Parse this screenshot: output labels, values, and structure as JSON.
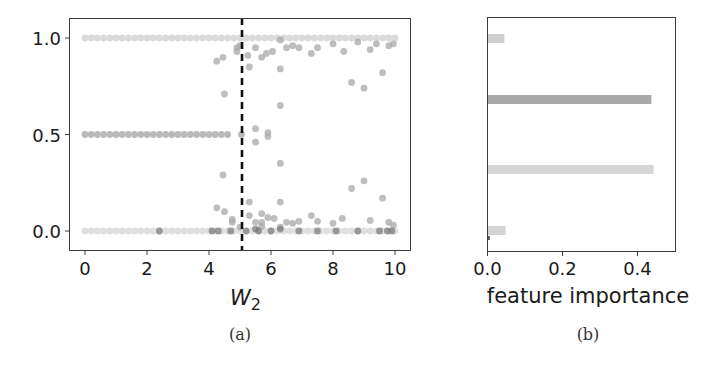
{
  "chart_data": [
    {
      "panel": "a",
      "type": "scatter",
      "title": "",
      "caption": "(a)",
      "xlabel": "W",
      "xlabel_subscript": "2",
      "ylabel": "",
      "xlim": [
        -0.4,
        10.5
      ],
      "ylim": [
        -0.1,
        1.08
      ],
      "xticks": [
        "0",
        "2",
        "4",
        "6",
        "8",
        "10"
      ],
      "yticks": [
        "0.0",
        "0.5",
        "1.0"
      ],
      "grid": false,
      "vline": {
        "x": 5.06,
        "style": "dashed",
        "color": "#111111"
      },
      "series": [
        {
          "name": "row-1.0",
          "color": "#d4d4d4",
          "points_rule": "x from 0 to 10 step 0.2, y = 1.0"
        },
        {
          "name": "row-0.5",
          "color": "#b3b3b3",
          "points_rule": "x from 0 to 4.6 step 0.2, y = 0.5, plus (5.05, 0.5)"
        },
        {
          "name": "row-0.0",
          "color": "#d9d9d9",
          "points_rule": "x from 0 to 10 step 0.2, y = 0.0"
        },
        {
          "name": "transition-points",
          "color": "#a8a8a8",
          "points": [
            [
              4.25,
              0.88
            ],
            [
              4.45,
              0.9
            ],
            [
              4.9,
              0.93
            ],
            [
              4.9,
              0.95
            ],
            [
              5.0,
              0.96
            ],
            [
              5.25,
              0.91
            ],
            [
              5.5,
              0.95
            ],
            [
              5.7,
              0.9
            ],
            [
              5.85,
              0.92
            ],
            [
              6.05,
              0.93
            ],
            [
              6.3,
              0.99
            ],
            [
              6.5,
              0.95
            ],
            [
              6.7,
              0.96
            ],
            [
              6.9,
              0.95
            ],
            [
              7.3,
              0.92
            ],
            [
              7.5,
              0.95
            ],
            [
              8.0,
              0.97
            ],
            [
              8.35,
              0.93
            ],
            [
              8.8,
              0.98
            ],
            [
              9.2,
              0.94
            ],
            [
              9.4,
              0.97
            ],
            [
              9.8,
              0.96
            ],
            [
              9.95,
              0.97
            ],
            [
              5.3,
              0.85
            ],
            [
              6.3,
              0.84
            ],
            [
              8.6,
              0.77
            ],
            [
              9.0,
              0.74
            ],
            [
              9.6,
              0.82
            ],
            [
              4.5,
              0.71
            ],
            [
              6.3,
              0.65
            ],
            [
              5.5,
              0.53
            ],
            [
              5.9,
              0.51
            ],
            [
              5.9,
              0.49
            ],
            [
              5.5,
              0.46
            ],
            [
              6.3,
              0.35
            ],
            [
              4.45,
              0.29
            ],
            [
              9.0,
              0.26
            ],
            [
              8.6,
              0.22
            ],
            [
              9.6,
              0.17
            ],
            [
              5.3,
              0.15
            ],
            [
              6.3,
              0.15
            ],
            [
              4.25,
              0.12
            ],
            [
              4.5,
              0.1
            ],
            [
              5.7,
              0.09
            ],
            [
              5.3,
              0.08
            ],
            [
              5.9,
              0.07
            ],
            [
              6.1,
              0.065
            ],
            [
              7.3,
              0.08
            ],
            [
              8.3,
              0.065
            ],
            [
              9.2,
              0.055
            ],
            [
              4.75,
              0.06
            ],
            [
              4.75,
              0.045
            ],
            [
              5.5,
              0.045
            ],
            [
              5.7,
              0.045
            ],
            [
              6.5,
              0.045
            ],
            [
              6.7,
              0.04
            ],
            [
              6.9,
              0.05
            ],
            [
              7.5,
              0.05
            ],
            [
              8.0,
              0.04
            ],
            [
              9.8,
              0.045
            ],
            [
              9.95,
              0.03
            ],
            [
              5.0,
              0.02
            ],
            [
              5.7,
              0.025
            ],
            [
              6.3,
              0.02
            ]
          ]
        },
        {
          "name": "dark-points-near-zero",
          "color": "#777777",
          "points": [
            [
              2.4,
              0.0
            ],
            [
              4.1,
              0.0
            ],
            [
              4.3,
              0.0
            ],
            [
              4.7,
              0.0
            ],
            [
              5.2,
              0.0
            ],
            [
              5.5,
              0.01
            ],
            [
              5.6,
              0.0
            ],
            [
              6.0,
              0.0
            ],
            [
              6.3,
              0.01
            ],
            [
              6.9,
              0.0
            ],
            [
              7.5,
              0.0
            ],
            [
              8.1,
              0.0
            ],
            [
              8.8,
              0.0
            ],
            [
              9.5,
              0.0
            ],
            [
              9.75,
              0.0
            ],
            [
              9.9,
              0.0
            ]
          ]
        }
      ]
    },
    {
      "panel": "b",
      "type": "bar",
      "orientation": "horizontal",
      "title": "",
      "caption": "(b)",
      "xlabel": "feature importance",
      "ylabel": "",
      "xlim": [
        0.0,
        0.5
      ],
      "xticks": [
        "0.0",
        "0.2",
        "0.4"
      ],
      "grid": false,
      "categories": [
        "feature-1",
        "feature-2",
        "feature-3",
        "feature-4"
      ],
      "values": [
        0.045,
        0.437,
        0.443,
        0.048
      ],
      "colors": [
        "#cfcfcf",
        "#a9a9a9",
        "#d6d6d6",
        "#d3d3d3"
      ],
      "annotations": [
        {
          "note": "tiny dark bar below feature-4",
          "value": 0.004,
          "color": "#555555"
        }
      ]
    }
  ]
}
